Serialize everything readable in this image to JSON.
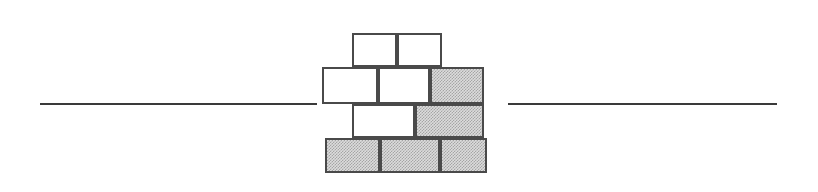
{
  "figure": {
    "name": "brick-wall-divider",
    "width": 818,
    "height": 192,
    "background_color": "#ffffff"
  },
  "colors": {
    "rule": "#3a3a3a",
    "brick_border": "#4a4a4a",
    "brick_white_fill": "#ffffff",
    "brick_gray_fill": "#dcdcdc"
  },
  "rules": [
    {
      "name": "left-rule",
      "x": 40,
      "y": 103,
      "width": 277,
      "height": 2
    },
    {
      "name": "right-rule",
      "x": 508,
      "y": 103,
      "width": 269,
      "height": 2
    }
  ],
  "wall": {
    "rows": [
      {
        "name": "brick-row-1",
        "index": 1,
        "y": 33,
        "height": 34,
        "bricks": [
          {
            "name": "brick-r1-c1",
            "fill": "white",
            "x": 352,
            "width": 45
          },
          {
            "name": "brick-r1-c2",
            "fill": "white",
            "x": 397,
            "width": 45
          }
        ]
      },
      {
        "name": "brick-row-2",
        "index": 2,
        "y": 67,
        "height": 37,
        "bricks": [
          {
            "name": "brick-r2-c1",
            "fill": "white",
            "x": 322,
            "width": 56
          },
          {
            "name": "brick-r2-c2",
            "fill": "white",
            "x": 378,
            "width": 52
          },
          {
            "name": "brick-r2-c3",
            "fill": "gray",
            "x": 430,
            "width": 54
          }
        ]
      },
      {
        "name": "brick-row-3",
        "index": 3,
        "y": 104,
        "height": 34,
        "bricks": [
          {
            "name": "brick-r3-c1",
            "fill": "white",
            "x": 352,
            "width": 63
          },
          {
            "name": "brick-r3-c2",
            "fill": "gray",
            "x": 415,
            "width": 69
          }
        ]
      },
      {
        "name": "brick-row-4",
        "index": 4,
        "y": 138,
        "height": 35,
        "bricks": [
          {
            "name": "brick-r4-c1",
            "fill": "gray",
            "x": 325,
            "width": 55
          },
          {
            "name": "brick-r4-c2",
            "fill": "gray",
            "x": 380,
            "width": 60
          },
          {
            "name": "brick-r4-c3",
            "fill": "gray",
            "x": 440,
            "width": 47
          }
        ]
      }
    ]
  }
}
